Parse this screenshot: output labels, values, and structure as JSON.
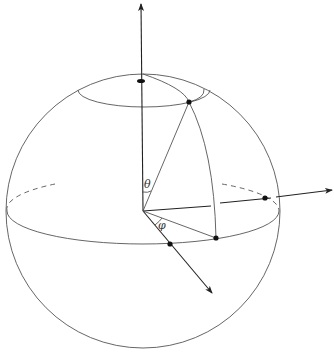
{
  "diagram": {
    "type": "spherical-coordinates",
    "labels": {
      "theta": "θ",
      "phi": "φ"
    },
    "colors": {
      "line": "#555555",
      "axis": "#222222",
      "dot": "#111111",
      "background": "#ffffff"
    },
    "elements": {
      "sphere": "outline circle",
      "equator": "ellipse, front solid, back dashed",
      "polar_cap": "small latitude circle near north pole",
      "axes": [
        "z-axis (up)",
        "y-axis (right)",
        "x-axis (down-right)"
      ],
      "points": [
        "north cap pole",
        "point on sphere",
        "projection on equator",
        "x-axis intersection",
        "y-axis intersection"
      ]
    }
  }
}
